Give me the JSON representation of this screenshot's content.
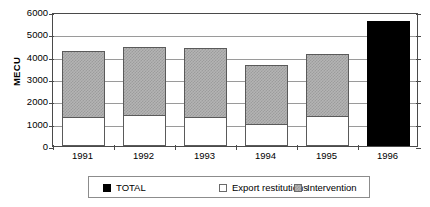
{
  "chart_data": {
    "type": "bar",
    "title": "",
    "subtitle": "",
    "xlabel": "",
    "ylabel": "MECU",
    "categories": [
      "1991",
      "1992",
      "1993",
      "1994",
      "1995",
      "1996"
    ],
    "ylim": [
      0,
      6000
    ],
    "ytick_labels": [
      "6000",
      "5000",
      "4000",
      "3000",
      "2000",
      "1000",
      "0"
    ],
    "ytick_values": [
      6000,
      5000,
      4000,
      3000,
      2000,
      1000,
      0
    ],
    "grid": true,
    "stacked": true,
    "legend_position": "bottom",
    "series": [
      {
        "name": "Export restitutions",
        "color": "#ffffff",
        "values": [
          1300,
          1400,
          1300,
          1000,
          1350,
          null
        ]
      },
      {
        "name": "Intervention",
        "color": "#b4b4b4",
        "values": [
          2950,
          3050,
          3100,
          2650,
          2750,
          null
        ]
      },
      {
        "name": "TOTAL",
        "color": "#000000",
        "values": [
          null,
          null,
          null,
          null,
          null,
          5600
        ]
      }
    ],
    "bar_totals": [
      4250,
      4450,
      4400,
      3650,
      4100,
      5600
    ]
  },
  "legend": {
    "items": [
      {
        "label": "TOTAL",
        "swatch": "black"
      },
      {
        "label": "Export restitutions",
        "swatch": "white"
      },
      {
        "label": "Intervention",
        "swatch": "gray"
      }
    ]
  },
  "axis": {
    "y_title": "MECU"
  }
}
